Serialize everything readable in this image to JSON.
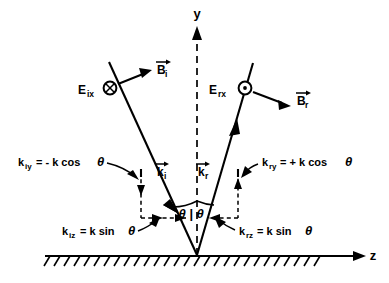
{
  "figure": {
    "background_color": "#ffffff",
    "ink_color": "#000000",
    "width": 389,
    "height": 283
  },
  "axes": {
    "y_label": "y",
    "z_label": "z",
    "y_axis_style": "dashed vertical with upward arrow",
    "z_axis_style": "solid horizontal with rightward arrow"
  },
  "boundary": {
    "name": "conducting-surface",
    "style": "solid line with hatching below",
    "hatch_count": 26
  },
  "incident": {
    "e_field_label": "E",
    "e_field_sub": "ix",
    "e_field_direction_symbol": "circle-x",
    "e_field_direction_meaning": "into page",
    "b_field_label": "B",
    "b_field_sub": "i",
    "k_label": "k",
    "k_sub": "i",
    "ky_equation": "k",
    "ky_equation_sub": "iy",
    "ky_equation_rhs": "= - k cos",
    "ky_equation_theta": "θ",
    "kz_equation": "k",
    "kz_equation_sub": "iz",
    "kz_equation_rhs": "= k sin",
    "kz_equation_theta": "θ"
  },
  "reflected": {
    "e_field_label": "E",
    "e_field_sub": "rx",
    "e_field_direction_symbol": "circle-dot",
    "e_field_direction_meaning": "out of page",
    "b_field_label": "B",
    "b_field_sub": "r",
    "k_label": "k",
    "k_sub": "r",
    "ky_equation": "k",
    "ky_equation_sub": "ry",
    "ky_equation_rhs": "= + k cos",
    "ky_equation_theta": "θ",
    "kz_equation": "k",
    "kz_equation_sub": "rz",
    "kz_equation_rhs": "= k sin",
    "kz_equation_theta": "θ"
  },
  "angles": {
    "incident_theta": "θ",
    "reflected_theta": "θ",
    "separator": "|"
  }
}
